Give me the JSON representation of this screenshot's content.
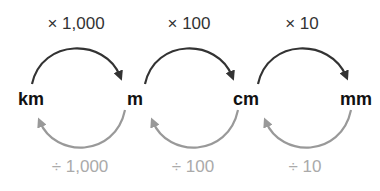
{
  "units": [
    "km",
    "m",
    "cm",
    "mm"
  ],
  "multiply_labels": [
    "× 1,000",
    "× 100",
    "× 10"
  ],
  "divide_labels": [
    "÷ 1,000",
    "÷ 100",
    "÷ 10"
  ],
  "colors": {
    "multiply_arrow": "#333333",
    "divide_arrow": "#999999",
    "unit_text": "#111111",
    "multiply_text": "#333333",
    "divide_text": "#aaaaaa"
  }
}
